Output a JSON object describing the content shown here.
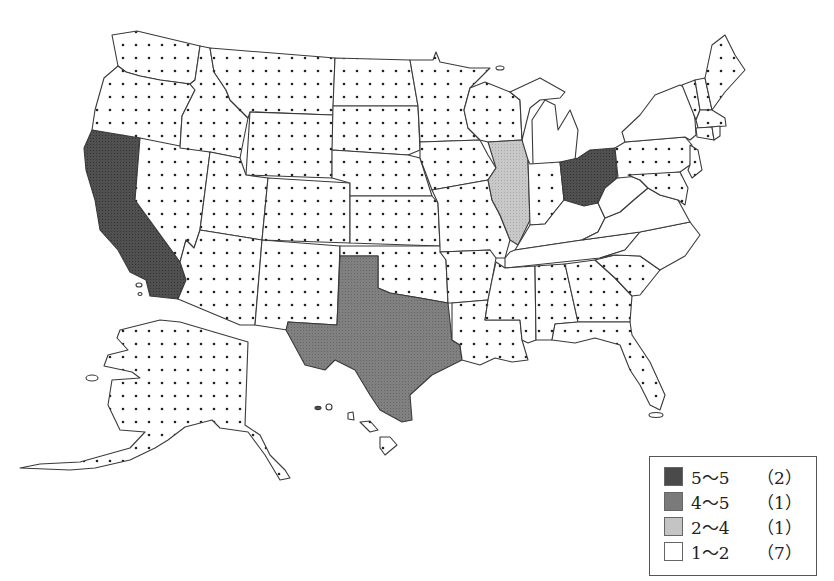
{
  "map": {
    "type": "choropleth",
    "region": "United States",
    "patterns": {
      "dotted": "dots",
      "dark": "#4a4a4a",
      "medium": "#7a7a7a",
      "light": "#c4c4c4",
      "blank": "#ffffff"
    },
    "states": {
      "dark": [
        "California",
        "Ohio"
      ],
      "medium": [
        "Texas"
      ],
      "light": [
        "Illinois"
      ],
      "blank": [
        "Michigan",
        "New York",
        "Kentucky",
        "West Virginia",
        "Virginia",
        "Tennessee",
        "North Carolina"
      ],
      "dotted": [
        "Washington",
        "Oregon",
        "Idaho",
        "Montana",
        "Wyoming",
        "Nevada",
        "Utah",
        "Colorado",
        "Arizona",
        "New Mexico",
        "North Dakota",
        "South Dakota",
        "Nebraska",
        "Kansas",
        "Oklahoma",
        "Minnesota",
        "Iowa",
        "Missouri",
        "Arkansas",
        "Louisiana",
        "Wisconsin",
        "Indiana",
        "Mississippi",
        "Alabama",
        "Georgia",
        "Florida",
        "South Carolina",
        "Pennsylvania",
        "New Jersey",
        "Delaware",
        "Maryland",
        "Maine",
        "New Hampshire",
        "Vermont",
        "Massachusetts",
        "Connecticut",
        "Rhode Island",
        "Alaska",
        "Hawaii"
      ]
    }
  },
  "legend": {
    "items": [
      {
        "range": "5～5",
        "count": "（2）",
        "fill": "#4a4a4a"
      },
      {
        "range": "4～5",
        "count": "（1）",
        "fill": "#7a7a7a"
      },
      {
        "range": "2～4",
        "count": "（1）",
        "fill": "#c4c4c4"
      },
      {
        "range": "1～2",
        "count": "（7）",
        "fill": "#ffffff"
      }
    ]
  }
}
